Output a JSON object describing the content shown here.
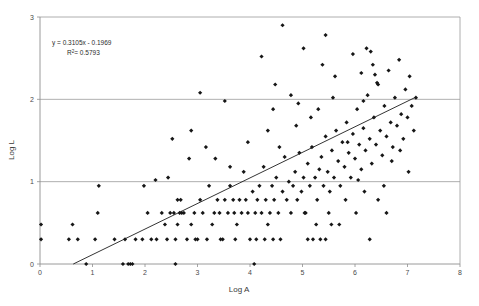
{
  "chart_data": {
    "type": "scatter",
    "title": "",
    "xlabel": "Log A",
    "ylabel": "Log L",
    "xlim": [
      0,
      8
    ],
    "ylim": [
      0,
      3
    ],
    "xticks": [
      0,
      1,
      2,
      3,
      4,
      5,
      6,
      7,
      8
    ],
    "xtick_labels": [
      "0",
      "1",
      "2",
      "3",
      "4",
      "5",
      "6",
      "7",
      "8"
    ],
    "yticks": [
      0,
      1,
      2,
      3
    ],
    "ytick_labels": [
      "0",
      "1",
      "2",
      "3"
    ],
    "grid": "horizontal",
    "legend": "none",
    "annotations": {
      "equation": "y = 0.3105x - 0.1969",
      "r_squared_prefix": "R",
      "r_squared_sup": "2",
      "r_squared_value": "= 0.5793"
    },
    "trendline": {
      "type": "linear",
      "slope": 0.3105,
      "intercept": -0.1969,
      "x_start": 0.634,
      "x_end": 7.15,
      "y_start": 0.0,
      "y_end": 2.024
    },
    "marker": {
      "shape": "diamond",
      "size": 2.1,
      "color": "#161616"
    },
    "points": [
      [
        0.02,
        0.48
      ],
      [
        0.02,
        0.3
      ],
      [
        0.55,
        0.3
      ],
      [
        0.62,
        0.48
      ],
      [
        0.72,
        0.3
      ],
      [
        0.88,
        0.0
      ],
      [
        1.05,
        0.3
      ],
      [
        1.1,
        0.62
      ],
      [
        1.12,
        0.95
      ],
      [
        1.42,
        0.3
      ],
      [
        1.58,
        0.0
      ],
      [
        1.68,
        0.0
      ],
      [
        1.72,
        0.0
      ],
      [
        1.76,
        0.0
      ],
      [
        1.62,
        0.3
      ],
      [
        1.82,
        0.3
      ],
      [
        1.95,
        0.3
      ],
      [
        2.05,
        0.62
      ],
      [
        2.12,
        0.3
      ],
      [
        2.22,
        0.3
      ],
      [
        2.32,
        0.62
      ],
      [
        2.38,
        0.48
      ],
      [
        2.42,
        0.3
      ],
      [
        2.48,
        0.62
      ],
      [
        2.55,
        0.62
      ],
      [
        2.58,
        0.3
      ],
      [
        2.62,
        0.48
      ],
      [
        2.66,
        0.62
      ],
      [
        2.7,
        0.62
      ],
      [
        2.74,
        0.62
      ],
      [
        2.62,
        0.78
      ],
      [
        2.68,
        0.78
      ],
      [
        2.8,
        0.3
      ],
      [
        2.84,
        1.28
      ],
      [
        2.88,
        0.48
      ],
      [
        2.94,
        0.62
      ],
      [
        3.0,
        0.3
      ],
      [
        3.05,
        0.78
      ],
      [
        3.1,
        0.62
      ],
      [
        3.18,
        0.3
      ],
      [
        3.22,
        0.95
      ],
      [
        3.28,
        0.48
      ],
      [
        3.32,
        0.62
      ],
      [
        3.38,
        0.78
      ],
      [
        3.42,
        0.62
      ],
      [
        3.48,
        0.3
      ],
      [
        3.52,
        0.78
      ],
      [
        3.58,
        0.62
      ],
      [
        3.62,
        0.95
      ],
      [
        3.68,
        0.78
      ],
      [
        3.7,
        0.62
      ],
      [
        3.75,
        0.48
      ],
      [
        3.8,
        0.78
      ],
      [
        3.84,
        0.62
      ],
      [
        3.88,
        1.12
      ],
      [
        3.92,
        0.78
      ],
      [
        3.96,
        0.62
      ],
      [
        4.0,
        0.3
      ],
      [
        4.05,
        0.88
      ],
      [
        4.08,
        0.0
      ],
      [
        4.1,
        0.62
      ],
      [
        4.14,
        0.78
      ],
      [
        4.18,
        0.95
      ],
      [
        4.22,
        0.62
      ],
      [
        4.26,
        1.18
      ],
      [
        4.3,
        0.78
      ],
      [
        4.34,
        0.48
      ],
      [
        4.38,
        0.62
      ],
      [
        4.42,
        0.95
      ],
      [
        4.46,
        0.78
      ],
      [
        4.5,
        1.05
      ],
      [
        4.54,
        0.62
      ],
      [
        4.58,
        0.3
      ],
      [
        4.62,
        0.88
      ],
      [
        4.66,
        1.3
      ],
      [
        4.7,
        0.78
      ],
      [
        4.74,
        1.0
      ],
      [
        4.78,
        0.62
      ],
      [
        4.82,
        0.95
      ],
      [
        4.86,
        1.12
      ],
      [
        4.9,
        0.78
      ],
      [
        4.94,
        1.35
      ],
      [
        4.98,
        0.88
      ],
      [
        5.02,
        1.05
      ],
      [
        5.06,
        0.62
      ],
      [
        5.1,
        1.22
      ],
      [
        5.14,
        0.95
      ],
      [
        5.18,
        1.42
      ],
      [
        5.2,
        0.3
      ],
      [
        5.24,
        1.05
      ],
      [
        5.28,
        0.78
      ],
      [
        5.32,
        1.15
      ],
      [
        5.36,
        1.3
      ],
      [
        5.4,
        0.95
      ],
      [
        5.44,
        1.55
      ],
      [
        5.48,
        1.12
      ],
      [
        5.52,
        0.88
      ],
      [
        5.56,
        1.38
      ],
      [
        5.6,
        1.05
      ],
      [
        5.64,
        1.62
      ],
      [
        5.68,
        1.25
      ],
      [
        5.72,
        0.95
      ],
      [
        5.76,
        1.48
      ],
      [
        5.8,
        1.18
      ],
      [
        5.84,
        1.72
      ],
      [
        5.88,
        1.35
      ],
      [
        5.92,
        1.05
      ],
      [
        5.96,
        1.58
      ],
      [
        6.0,
        1.28
      ],
      [
        6.04,
        1.88
      ],
      [
        6.08,
        1.45
      ],
      [
        6.12,
        1.15
      ],
      [
        6.16,
        1.65
      ],
      [
        6.2,
        1.38
      ],
      [
        6.24,
        2.05
      ],
      [
        6.28,
        1.52
      ],
      [
        6.32,
        1.22
      ],
      [
        6.36,
        1.78
      ],
      [
        6.4,
        1.45
      ],
      [
        6.44,
        2.18
      ],
      [
        6.48,
        1.62
      ],
      [
        6.52,
        1.32
      ],
      [
        6.56,
        1.92
      ],
      [
        6.6,
        1.55
      ],
      [
        6.64,
        2.35
      ],
      [
        6.68,
        1.72
      ],
      [
        6.72,
        1.42
      ],
      [
        6.76,
        2.02
      ],
      [
        6.8,
        1.68
      ],
      [
        6.84,
        2.48
      ],
      [
        6.88,
        1.82
      ],
      [
        6.92,
        1.52
      ],
      [
        6.96,
        2.12
      ],
      [
        7.0,
        1.78
      ],
      [
        7.04,
        2.28
      ],
      [
        7.08,
        1.92
      ],
      [
        7.12,
        1.62
      ],
      [
        7.16,
        2.02
      ],
      [
        3.05,
        2.08
      ],
      [
        4.22,
        2.52
      ],
      [
        4.62,
        2.9
      ],
      [
        5.02,
        2.62
      ],
      [
        5.38,
        2.42
      ],
      [
        5.44,
        2.78
      ],
      [
        5.62,
        2.28
      ],
      [
        5.96,
        2.55
      ],
      [
        6.12,
        2.32
      ],
      [
        6.22,
        2.62
      ],
      [
        6.3,
        2.58
      ],
      [
        6.34,
        2.42
      ],
      [
        6.38,
        2.3
      ],
      [
        6.42,
        2.2
      ],
      [
        4.48,
        2.18
      ],
      [
        4.78,
        2.05
      ],
      [
        3.52,
        1.98
      ],
      [
        2.52,
        1.52
      ],
      [
        2.2,
        1.02
      ],
      [
        1.98,
        0.95
      ],
      [
        6.55,
        0.95
      ],
      [
        5.55,
        0.48
      ],
      [
        5.7,
        0.48
      ],
      [
        5.1,
        0.3
      ],
      [
        5.34,
        0.3
      ],
      [
        5.44,
        0.3
      ],
      [
        6.28,
        0.3
      ],
      [
        4.12,
        0.3
      ],
      [
        4.28,
        0.3
      ],
      [
        4.44,
        0.3
      ],
      [
        3.72,
        0.3
      ],
      [
        3.44,
        0.3
      ],
      [
        2.96,
        0.3
      ],
      [
        2.58,
        0.0
      ],
      [
        5.04,
        0.62
      ],
      [
        5.26,
        0.48
      ],
      [
        5.5,
        0.62
      ],
      [
        5.82,
        0.78
      ],
      [
        6.02,
        0.62
      ],
      [
        6.44,
        0.78
      ],
      [
        6.6,
        0.62
      ],
      [
        6.18,
        0.88
      ],
      [
        3.96,
        1.48
      ],
      [
        4.34,
        1.62
      ],
      [
        4.56,
        1.42
      ],
      [
        4.88,
        1.68
      ],
      [
        5.16,
        1.78
      ],
      [
        2.88,
        1.62
      ],
      [
        3.16,
        1.42
      ],
      [
        3.34,
        1.28
      ],
      [
        3.62,
        1.18
      ],
      [
        2.44,
        1.05
      ],
      [
        6.7,
        1.25
      ],
      [
        6.86,
        1.38
      ],
      [
        7.02,
        1.12
      ],
      [
        6.06,
        1.02
      ],
      [
        5.86,
        1.48
      ],
      [
        4.44,
        1.88
      ],
      [
        4.92,
        1.95
      ],
      [
        5.3,
        1.88
      ],
      [
        5.58,
        2.02
      ],
      [
        6.16,
        1.98
      ]
    ]
  }
}
